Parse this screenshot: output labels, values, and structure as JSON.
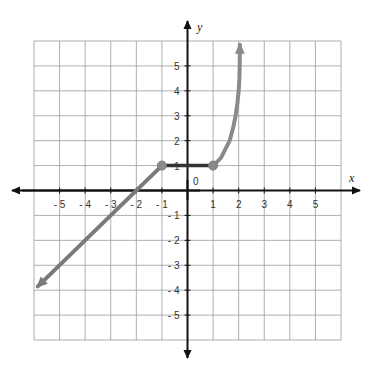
{
  "chart_data": {
    "type": "line",
    "title": "",
    "xlabel": "x",
    "ylabel": "y",
    "xlim": [
      -6,
      6
    ],
    "ylim": [
      -6,
      6
    ],
    "grid": true,
    "origin_label": "0",
    "x_ticks": [
      -5,
      -4,
      -3,
      -2,
      -1,
      1,
      2,
      3,
      4,
      5
    ],
    "x_tick_labels": [
      "- 5",
      "- 4",
      "- 3",
      "- 2",
      "- 1",
      "1",
      "2",
      "3",
      "4",
      "5"
    ],
    "y_ticks": [
      5,
      4,
      3,
      2,
      1,
      -1,
      -2,
      -3,
      -4,
      -5
    ],
    "y_tick_labels": [
      "5",
      "4",
      "3",
      "2",
      "1",
      "- 1",
      "- 2",
      "- 3",
      "- 4",
      "- 5"
    ],
    "series": [
      {
        "name": "linear piece",
        "description": "y = x + 2 for x <= -1, arrow to the lower left",
        "color": "#7a7a7a",
        "points": [
          [
            -5.85,
            -3.85
          ],
          [
            -1,
            1
          ]
        ],
        "arrow_start": true,
        "endpoint": {
          "x": -1,
          "y": 1,
          "closed": true
        }
      },
      {
        "name": "constant piece",
        "description": "y = 1 for -1 <= x <= 1",
        "color": "#333333",
        "points": [
          [
            -1,
            1
          ],
          [
            1,
            1
          ]
        ]
      },
      {
        "name": "increasing curve",
        "description": "curve rising steeply from (1,1), arrow upward",
        "color": "#8a8a8a",
        "points": [
          [
            1,
            1
          ],
          [
            1.3,
            1.3
          ],
          [
            1.5,
            1.7
          ],
          [
            1.65,
            2
          ],
          [
            1.8,
            2.6
          ],
          [
            1.88,
            3
          ],
          [
            1.95,
            3.5
          ],
          [
            2.0,
            4
          ],
          [
            2.03,
            4.5
          ],
          [
            2.04,
            5
          ],
          [
            2.05,
            5.85
          ]
        ],
        "arrow_end": true,
        "endpoint": {
          "x": 1,
          "y": 1,
          "closed": true
        }
      }
    ],
    "points": [
      {
        "x": -1,
        "y": 1,
        "filled": true
      },
      {
        "x": 1,
        "y": 1,
        "filled": true
      }
    ]
  }
}
